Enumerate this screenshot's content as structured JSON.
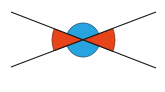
{
  "diagram": {
    "type": "vertical-angles",
    "center": {
      "x": 83,
      "y": 40
    },
    "lines": [
      {
        "id": "line-a",
        "x1": 11,
        "y1": 12,
        "x2": 156,
        "y2": 68
      },
      {
        "id": "line-b",
        "x1": 11,
        "y1": 67,
        "x2": 156,
        "y2": 12
      }
    ],
    "circle": {
      "r": 17,
      "fill": "#27a3e0",
      "stroke": "#1d4f6e"
    },
    "sectors": [
      {
        "id": "left",
        "r": 31,
        "fill": "#e8441a"
      },
      {
        "id": "right",
        "r": 32,
        "fill": "#e8441a"
      }
    ],
    "line_color": "#1a1a1a",
    "sector_stroke": "#5a1a0a"
  }
}
